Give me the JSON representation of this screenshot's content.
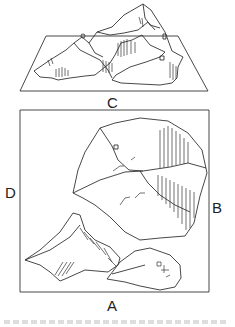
{
  "figure": {
    "labels": {
      "top_view": "C",
      "left": "D",
      "right": "B",
      "bottom": "A"
    },
    "colors": {
      "line": "#333333",
      "background": "#ffffff"
    }
  }
}
